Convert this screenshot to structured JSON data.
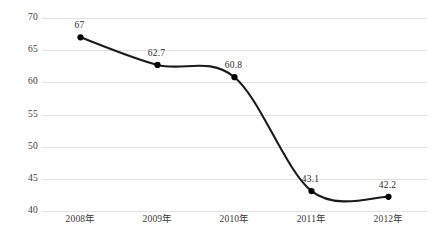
{
  "chart_data": {
    "type": "line",
    "title": "",
    "subtitle": "",
    "xlabel": "",
    "ylabel": "",
    "categories": [
      "2008年",
      "2009年",
      "2010年",
      "2011年",
      "2012年"
    ],
    "values": [
      67,
      62.7,
      60.8,
      43.1,
      42.2
    ],
    "point_labels": [
      "67",
      "62.7",
      "60.8",
      "43.1",
      "42.2"
    ],
    "ylim": [
      40,
      70
    ],
    "yticks": [
      70,
      65,
      60,
      55,
      50,
      45,
      40
    ],
    "ytick_labels": [
      "70",
      "65",
      "60",
      "55",
      "50",
      "45",
      "40"
    ],
    "grid": {
      "horizontal": true,
      "vertical": false,
      "color": "#e2e2e2"
    },
    "legend": {
      "visible": false,
      "position": "none",
      "entries": []
    },
    "style": {
      "line_color": "#1a1a1a",
      "marker_color": "#000000",
      "marker_shape": "circle",
      "smoothing": "spline",
      "background": "#ffffff",
      "label_color": "#2c2c2c",
      "axis_text_color": "#3a3a3a"
    }
  }
}
